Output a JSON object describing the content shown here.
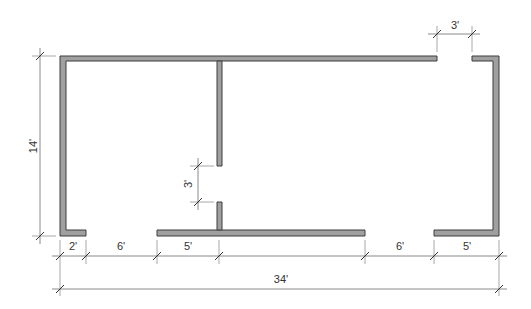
{
  "diagram": {
    "type": "floor-plan",
    "units": "feet",
    "colors": {
      "wall_fill": "#a0a0a0",
      "wall_stroke": "#3c3c3c",
      "dimension_line": "#8a8a8a",
      "label": "#333333"
    },
    "overall": {
      "width_label": "34'",
      "height_label": "14'"
    },
    "openings": {
      "top_door_label": "3'",
      "interior_door_label": "3'"
    },
    "bottom_segments": [
      {
        "label": "2'",
        "kind": "wall"
      },
      {
        "label": "6'",
        "kind": "opening"
      },
      {
        "label": "5'",
        "kind": "wall"
      },
      {
        "label": "6'",
        "kind": "opening"
      },
      {
        "label": "5'",
        "kind": "wall"
      }
    ]
  }
}
